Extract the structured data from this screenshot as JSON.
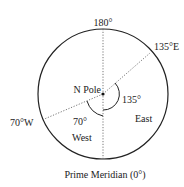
{
  "diagram": {
    "labels": {
      "top": "180°",
      "east_meridian": "135°E",
      "west_meridian": "70°W",
      "pole": "N Pole",
      "angle_east": "135°",
      "angle_west": "70°",
      "region_east": "East",
      "region_west": "West",
      "bottom": "Prime Meridian (0°)"
    },
    "colors": {
      "stroke": "#222222",
      "dotted": "#555555",
      "text": "#222222"
    }
  }
}
